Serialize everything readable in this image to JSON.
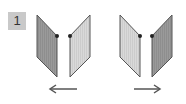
{
  "step": {
    "number": "1"
  },
  "colors": {
    "badge_bg": "#c9c9c9",
    "panel_dark": "#9a9a9a",
    "panel_light": "#d6d6d6",
    "edge": "#555555",
    "hinge": "#222222",
    "arrow": "#555555"
  },
  "figures": [
    {
      "name": "left-pair",
      "panels": [
        {
          "shade": "dark",
          "points": "37,15 57,36 57,77 37,57",
          "hinge": [
            57,
            36
          ]
        },
        {
          "shade": "light",
          "points": "70,36 90,15 90,57 70,77",
          "hinge": [
            70,
            36
          ]
        }
      ],
      "arrow": {
        "direction": "left",
        "x1": 77,
        "x2": 50,
        "y": 89
      }
    },
    {
      "name": "right-pair",
      "panels": [
        {
          "shade": "light",
          "points": "120,15 140,36 140,77 120,57",
          "hinge": [
            140,
            36
          ]
        },
        {
          "shade": "dark",
          "points": "152,36 172,15 172,57 152,77",
          "hinge": [
            152,
            36
          ]
        }
      ],
      "arrow": {
        "direction": "right",
        "x1": 134,
        "x2": 160,
        "y": 89
      }
    }
  ]
}
